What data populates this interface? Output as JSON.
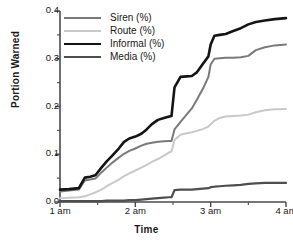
{
  "chart_data": {
    "type": "line",
    "title": "",
    "xlabel": "Time",
    "ylabel": "Portion Warned",
    "xlim": [
      0,
      3
    ],
    "ylim": [
      0.0,
      0.4
    ],
    "grid": false,
    "legend_position": "upper-left",
    "xtick_labels": [
      "1 am",
      "2 am",
      "3 am",
      "4 am"
    ],
    "xtick_values": [
      0,
      1,
      2,
      3
    ],
    "ytick_labels": [
      "0.0",
      "0.1",
      "0.2",
      "0.3",
      "0.4"
    ],
    "ytick_values": [
      0.0,
      0.1,
      0.2,
      0.3,
      0.4
    ],
    "minor_ytick_step": 0.05,
    "minor_xtick_step": 0.5,
    "x": [
      0.0,
      0.12,
      0.25,
      0.33,
      0.4,
      0.47,
      0.55,
      0.62,
      0.7,
      0.78,
      0.85,
      0.92,
      1.0,
      1.08,
      1.15,
      1.22,
      1.3,
      1.38,
      1.45,
      1.48,
      1.52,
      1.6,
      1.68,
      1.75,
      1.82,
      1.9,
      1.97,
      2.0,
      2.05,
      2.12,
      2.2,
      2.3,
      2.4,
      2.5,
      2.6,
      2.72,
      2.85,
      3.0
    ],
    "series": [
      {
        "name": "Siren (%)",
        "color": "#7a7a7a",
        "width": 2.0,
        "values": [
          0.022,
          0.024,
          0.026,
          0.045,
          0.047,
          0.049,
          0.062,
          0.072,
          0.083,
          0.093,
          0.101,
          0.107,
          0.112,
          0.118,
          0.122,
          0.124,
          0.126,
          0.127,
          0.128,
          0.128,
          0.152,
          0.168,
          0.183,
          0.196,
          0.215,
          0.238,
          0.262,
          0.288,
          0.3,
          0.301,
          0.302,
          0.302,
          0.303,
          0.306,
          0.318,
          0.324,
          0.328,
          0.33
        ]
      },
      {
        "name": "Route (%)",
        "color": "#c9c9c9",
        "width": 2.0,
        "values": [
          0.008,
          0.009,
          0.01,
          0.012,
          0.016,
          0.02,
          0.026,
          0.033,
          0.04,
          0.047,
          0.054,
          0.06,
          0.066,
          0.072,
          0.078,
          0.084,
          0.09,
          0.097,
          0.104,
          0.106,
          0.13,
          0.141,
          0.144,
          0.146,
          0.149,
          0.153,
          0.158,
          0.163,
          0.17,
          0.176,
          0.179,
          0.18,
          0.181,
          0.183,
          0.188,
          0.192,
          0.194,
          0.195
        ]
      },
      {
        "name": "Informal (%)",
        "color": "#141414",
        "width": 2.6,
        "values": [
          0.026,
          0.027,
          0.029,
          0.051,
          0.053,
          0.056,
          0.072,
          0.085,
          0.098,
          0.112,
          0.126,
          0.133,
          0.137,
          0.143,
          0.152,
          0.163,
          0.172,
          0.176,
          0.179,
          0.18,
          0.24,
          0.262,
          0.263,
          0.264,
          0.272,
          0.29,
          0.305,
          0.33,
          0.348,
          0.35,
          0.352,
          0.358,
          0.364,
          0.372,
          0.377,
          0.38,
          0.383,
          0.385
        ]
      },
      {
        "name": "Media (%)",
        "color": "#4e4e4e",
        "width": 2.2,
        "values": [
          0.002,
          0.002,
          0.002,
          0.002,
          0.002,
          0.002,
          0.002,
          0.003,
          0.003,
          0.003,
          0.003,
          0.004,
          0.004,
          0.005,
          0.006,
          0.007,
          0.008,
          0.009,
          0.01,
          0.01,
          0.025,
          0.026,
          0.026,
          0.026,
          0.027,
          0.028,
          0.029,
          0.031,
          0.032,
          0.033,
          0.034,
          0.035,
          0.036,
          0.038,
          0.039,
          0.04,
          0.04,
          0.04
        ]
      }
    ]
  }
}
